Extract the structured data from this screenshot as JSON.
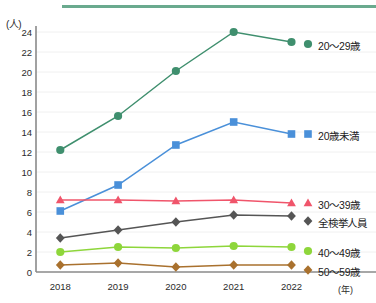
{
  "chart_data": {
    "type": "line",
    "title": "",
    "xlabel": "(年)",
    "ylabel": "(人)",
    "ylim": [
      0,
      24
    ],
    "ytick_step": 2,
    "grid": true,
    "legend_position": "right-inline",
    "categories": [
      "2018",
      "2019",
      "2020",
      "2021",
      "2022"
    ],
    "yticks": [
      "0",
      "2",
      "4",
      "6",
      "8",
      "10",
      "12",
      "14",
      "16",
      "18",
      "20",
      "22",
      "24"
    ],
    "series": [
      {
        "name": "20～29歳",
        "color": "#3f8f6e",
        "marker": "circle",
        "values": [
          12.2,
          15.6,
          20.1,
          24.0,
          23.0
        ]
      },
      {
        "name": "20歳未満",
        "color": "#4a90d9",
        "marker": "square",
        "values": [
          6.1,
          8.7,
          12.7,
          15.0,
          13.8
        ]
      },
      {
        "name": "30～39歳",
        "color": "#f0556b",
        "marker": "triangle",
        "values": [
          7.2,
          7.2,
          7.1,
          7.2,
          6.9
        ]
      },
      {
        "name": "全検挙人員",
        "color": "#555555",
        "marker": "diamond",
        "values": [
          3.4,
          4.2,
          5.0,
          5.7,
          5.6
        ]
      },
      {
        "name": "40～49歳",
        "color": "#8ed63b",
        "marker": "circle",
        "values": [
          2.0,
          2.5,
          2.4,
          2.6,
          2.5
        ]
      },
      {
        "name": "50～59歳",
        "color": "#a9712e",
        "marker": "diamond",
        "values": [
          0.7,
          0.9,
          0.5,
          0.7,
          0.7
        ]
      }
    ],
    "series_label_positions": [
      {
        "name": "20～29歳",
        "top": 38
      },
      {
        "name": "20歳未満",
        "top": 128
      },
      {
        "name": "30～39歳",
        "top": 197
      },
      {
        "name": "全検挙人員",
        "top": 215
      },
      {
        "name": "40～49歳",
        "top": 245
      },
      {
        "name": "50～59歳",
        "top": 264
      }
    ],
    "accent_rule_color": "#6aaa8e"
  }
}
